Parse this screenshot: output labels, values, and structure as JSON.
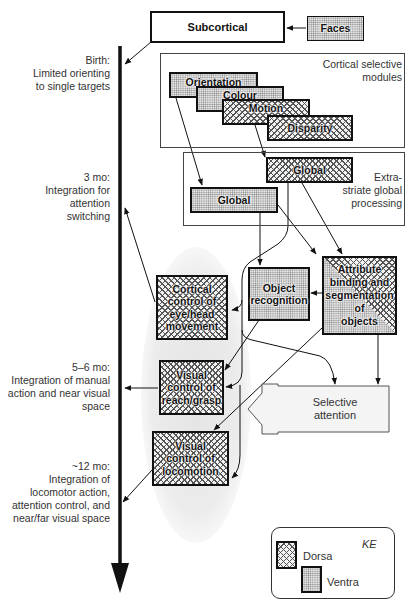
{
  "diagram": {
    "type": "developmental-neurocognitive-model",
    "colors": {
      "line": "#111111",
      "ellipse": "#ececec",
      "region_border": "#444444",
      "text": "#333333"
    }
  },
  "timeline": {
    "stages": [
      {
        "age": "Birth:",
        "lines": [
          "Limited orienting",
          "to single targets"
        ]
      },
      {
        "age": "3 mo:",
        "lines": [
          "Integration for",
          "attention",
          "switching"
        ]
      },
      {
        "age": "5–6 mo:",
        "lines": [
          "Integration of manual",
          "action and near visual",
          "space"
        ]
      },
      {
        "age": "~12 mo:",
        "lines": [
          "Integration of",
          "locomotor action,",
          "attention control, and",
          "near/far visual space"
        ]
      }
    ]
  },
  "nodes": {
    "subcortical": {
      "label": "Subcortical",
      "type": "plain"
    },
    "faces": {
      "label": "Faces",
      "type": "ventral"
    },
    "orientation": {
      "label": "Orientation",
      "type": "ventral"
    },
    "colour": {
      "label": "Colour",
      "type": "ventral"
    },
    "motion": {
      "label": "Motion",
      "type": "dorsal"
    },
    "disparity": {
      "label": "Disparity",
      "type": "dorsal"
    },
    "global_dorsal": {
      "label": "Global",
      "type": "dorsal"
    },
    "global_ventral": {
      "label": "Global",
      "type": "ventral"
    },
    "cortical_control": {
      "label_lines": [
        "Cortical",
        "control of",
        "eye/head",
        "movement"
      ],
      "type": "dorsal"
    },
    "object_recognition": {
      "label_lines": [
        "Object",
        "recognition"
      ],
      "type": "ventral"
    },
    "attribute_binding": {
      "label_lines": [
        "Attribute",
        "binding and",
        "segmentation",
        "of",
        "objects"
      ],
      "type": "mixed"
    },
    "visual_reach": {
      "label_lines": [
        "Visual",
        "control of",
        "reach/grasp"
      ],
      "type": "dorsal"
    },
    "visual_locomotion": {
      "label_lines": [
        "Visual",
        "control of",
        "locomotion"
      ],
      "type": "dorsal"
    },
    "selective_attention": {
      "label_lines": [
        "Selective",
        "attention"
      ],
      "type": "arrow"
    }
  },
  "regions": {
    "cortical_modules": {
      "label_lines": [
        "Cortical selective",
        "modules"
      ]
    },
    "extrastriate": {
      "label_lines": [
        "Extra-",
        "striate global",
        "processing"
      ]
    }
  },
  "legend": {
    "tag": "KE",
    "items": [
      {
        "label": "Dorsa",
        "type": "dorsal"
      },
      {
        "label": "Ventra",
        "type": "ventral"
      }
    ]
  }
}
